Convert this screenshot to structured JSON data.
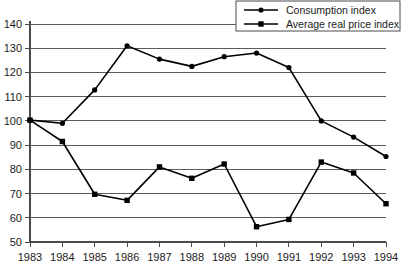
{
  "chart_data": {
    "type": "line",
    "title": "",
    "xlabel": "",
    "ylabel": "",
    "categories": [
      "1983",
      "1984",
      "1985",
      "1986",
      "1987",
      "1988",
      "1989",
      "1990",
      "1991",
      "1992",
      "1993",
      "1994"
    ],
    "ylim": [
      50,
      140
    ],
    "yticks": [
      50,
      60,
      70,
      80,
      90,
      100,
      110,
      120,
      130,
      140
    ],
    "grid": true,
    "legend_position": "top-right",
    "series": [
      {
        "name": "Consumption index",
        "marker": "circle",
        "values": [
          100.3,
          99.0,
          112.8,
          131.0,
          125.5,
          122.5,
          126.5,
          128.0,
          122.0,
          100.0,
          93.3,
          85.3
        ]
      },
      {
        "name": "Average real price index",
        "marker": "square",
        "values": [
          100.3,
          91.5,
          69.7,
          67.2,
          81.0,
          76.3,
          82.2,
          56.3,
          59.3,
          83.0,
          78.5,
          65.8
        ]
      }
    ]
  },
  "axis": {
    "y_tick_labels": [
      "140",
      "130",
      "120",
      "110",
      "100",
      "90",
      "80",
      "70",
      "60",
      "50"
    ],
    "x_tick_labels": [
      "1983",
      "1984",
      "1985",
      "1986",
      "1987",
      "1988",
      "1989",
      "1990",
      "1991",
      "1992",
      "1993",
      "1994"
    ]
  },
  "legend": {
    "items": [
      {
        "label": "Consumption index",
        "marker": "circle-marker"
      },
      {
        "label": "Average real price index",
        "marker": "square-marker"
      }
    ]
  },
  "colors": {
    "series": "#000000",
    "grid": "#5a5a5a",
    "axis": "#4a4a4a",
    "background": "#ffffff",
    "text": "#1a1a1a"
  }
}
